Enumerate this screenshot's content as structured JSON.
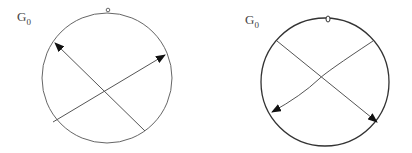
{
  "figures": [
    {
      "id": "left",
      "label": {
        "main": "G",
        "sub": "0"
      },
      "circle": {
        "cx": 107,
        "cy": 78,
        "r": 65,
        "stroke": "#666666"
      },
      "top_marker": {
        "x": 108,
        "y": 10
      },
      "arrows": [
        {
          "from": [
            53,
            122
          ],
          "to": [
            165,
            55
          ]
        },
        {
          "from": [
            145,
            131
          ],
          "to": [
            55,
            43
          ]
        }
      ]
    },
    {
      "id": "right",
      "label": {
        "main": "G",
        "sub": "0"
      },
      "circle": {
        "cx": 119,
        "cy": 82,
        "r": 64,
        "stroke": "#333333"
      },
      "top_marker": {
        "x": 122,
        "y": 19
      },
      "arrows": [
        {
          "from": [
            167,
            41
          ],
          "to": [
            66,
            112
          ]
        },
        {
          "from": [
            71,
            41
          ],
          "to": [
            171,
            122
          ]
        }
      ]
    }
  ]
}
